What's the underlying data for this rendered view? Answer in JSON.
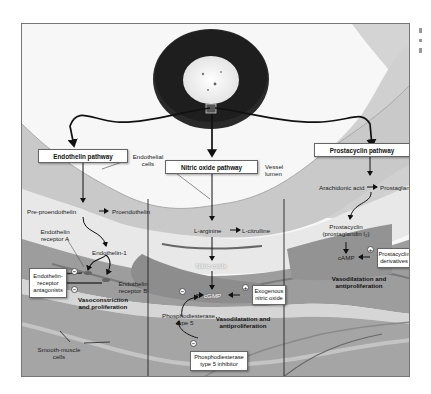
{
  "figure": {
    "type": "pathway diagram",
    "vessel_label": "Vessel lumen",
    "endothelial_cells_label": "Endothelial cells",
    "smooth_muscle_label": "Smooth-muscle cells"
  },
  "pathways": {
    "endothelin": {
      "title": "Endothelin pathway",
      "pre": "Pre-proendothelin",
      "pro": "Proendothelin",
      "et1": "Endothelin-1",
      "receptor_a": "Endothelin receptor A",
      "receptor_b": "Endothelin receptor B",
      "antagonists": "Endothelin-receptor antagonists",
      "antagonist_sign_top": "−",
      "antagonist_sign_bottom": "−",
      "effect": "Vasoconstriction and proliferation"
    },
    "nitric_oxide": {
      "title": "Nitric oxide pathway",
      "arginine": "L-arginine",
      "citrulline": "L-citrulline",
      "no": "Nitric oxide",
      "cgmp": "cGMP",
      "exogenous": "Exogenous nitric oxide",
      "exogenous_sign": "+",
      "pde5": "Phosphodiesterase type 5",
      "pde5_sign": "−",
      "pde5_inhibitor": "Phosphodiesterase type 5 inhibitor",
      "inhibitor_sign": "−",
      "effect": "Vasodilatation and antiproliferation"
    },
    "prostacyclin": {
      "title": "Prostacyclin pathway",
      "arachidonic": "Arachidonic acid",
      "pgi2": "Prostaglandin I₂",
      "prostacyclin": "Prostacyclin (prostaglandin I₂)",
      "camp": "cAMP",
      "derivatives": "Prostacyclin derivatives",
      "derivatives_sign": "+",
      "effect": "Vasodilatation and antiproliferation"
    }
  },
  "colors": {
    "lumen": "#f2f2f2",
    "endothelium": "#c9c9c9",
    "smooth_muscle_dark": "#8a8a8a",
    "smooth_muscle_mid": "#b0b0b0",
    "arrows": "#111111",
    "frame": "#777777"
  }
}
